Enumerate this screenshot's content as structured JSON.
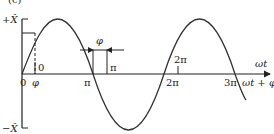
{
  "figure": {
    "panel_label": "(c)",
    "y_axis": {
      "top_label": "+X̂",
      "bottom_label": "−X̂"
    },
    "x_axis": {
      "label_upper": "ωt",
      "label_lower": "ωt + φ"
    },
    "ticks_below_axis": [
      "0",
      "φ",
      "π",
      "2π",
      "3π"
    ],
    "ticks_above_axis": [
      "0",
      "π",
      "2π"
    ],
    "phase_marker": {
      "label": "φ"
    },
    "curve": {
      "type": "sine",
      "phase_shift": "φ",
      "color": "#333333"
    }
  }
}
